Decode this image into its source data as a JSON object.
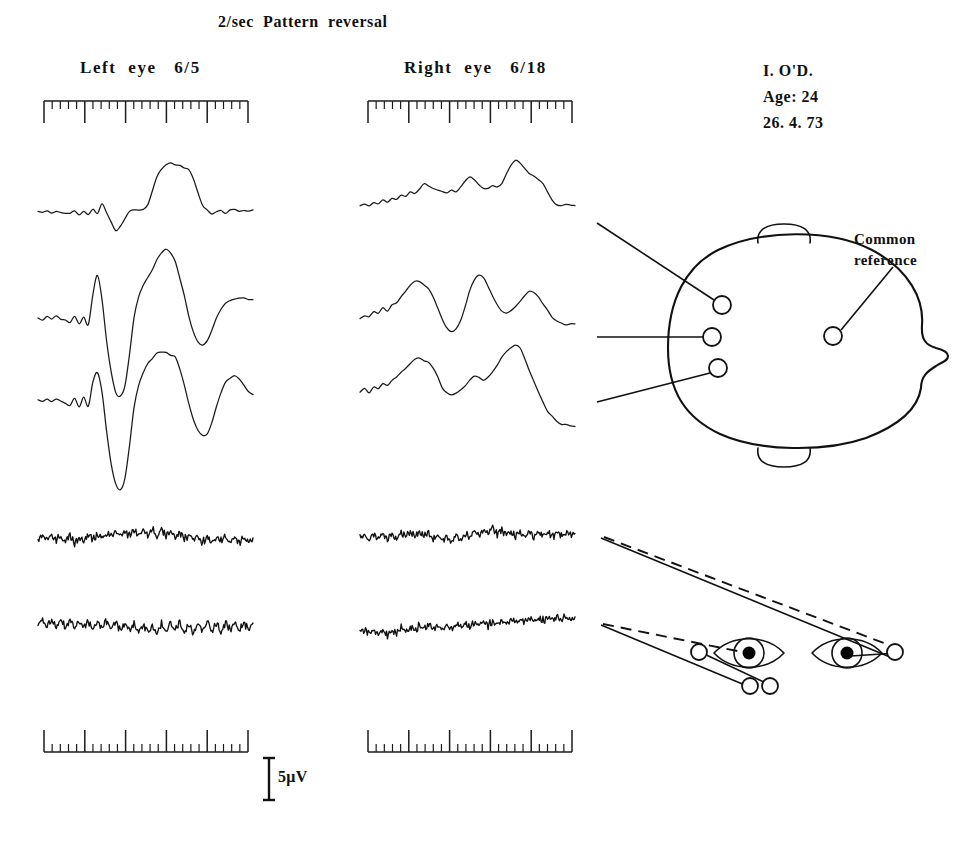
{
  "figure": {
    "title": "2/sec  Pattern  reversal",
    "type": "visual-evoked-potential-recording"
  },
  "columns": {
    "left": {
      "label": "Left  eye   6/5",
      "eye": "Left",
      "acuity": "6/5"
    },
    "right": {
      "label": "Right  eye   6/18",
      "eye": "Right",
      "acuity": "6/18"
    }
  },
  "patient": {
    "initials": "I. O'D.",
    "age_line": "Age: 24",
    "date_line": "26. 4. 73"
  },
  "annotations": {
    "common_reference_line1": "Common",
    "common_reference_line2": "reference"
  },
  "calibration": {
    "amplitude_label": "5μV",
    "amplitude_value": 5,
    "amplitude_unit": "μV"
  },
  "chart_data": {
    "type": "line",
    "title": "2/sec  Pattern  reversal",
    "xlabel": "",
    "ylabel": "",
    "grid": false,
    "legend_position": "none",
    "axis_note": "Horizontal timebase rulers at top and bottom of each column; vertical 5 microvolt calibration bar at lower centre.",
    "timebase": {
      "major_ticks": 5,
      "minor_ticks_per_major": 5,
      "top_ruler_tick_direction": "down",
      "bottom_ruler_tick_direction": "up"
    },
    "series": [
      {
        "name": "Left eye - channel 1 (upper occipital)",
        "column": "left",
        "values": [
          0,
          -1,
          2,
          -1,
          1,
          0,
          -1,
          -2,
          1,
          -3,
          0,
          -4,
          3,
          -3,
          12,
          -2,
          -14,
          -26,
          -20,
          -9,
          2,
          4,
          3,
          4,
          10,
          30,
          48,
          60,
          66,
          68,
          66,
          64,
          62,
          58,
          45,
          26,
          10,
          2,
          -2,
          0,
          2,
          -1,
          2,
          3,
          2,
          2,
          1,
          2
        ]
      },
      {
        "name": "Left eye - channel 2 (mid occipital)",
        "column": "left",
        "values": [
          0,
          -2,
          3,
          -2,
          2,
          -1,
          -3,
          -6,
          2,
          -7,
          2,
          -8,
          30,
          55,
          24,
          -30,
          -70,
          -95,
          -100,
          -88,
          -46,
          0,
          28,
          42,
          52,
          62,
          76,
          84,
          88,
          84,
          72,
          52,
          28,
          2,
          -18,
          -30,
          -34,
          -30,
          -16,
          0,
          12,
          18,
          22,
          24,
          26,
          25,
          24,
          24
        ]
      },
      {
        "name": "Left eye - channel 3 (lower occipital)",
        "column": "left",
        "values": [
          0,
          -2,
          2,
          -2,
          2,
          -1,
          -4,
          -6,
          2,
          -8,
          3,
          -9,
          22,
          34,
          10,
          -40,
          -82,
          -108,
          -116,
          -100,
          -58,
          -10,
          18,
          34,
          46,
          54,
          60,
          62,
          60,
          58,
          56,
          40,
          18,
          -6,
          -26,
          -40,
          -46,
          -44,
          -30,
          -8,
          10,
          22,
          28,
          30,
          26,
          18,
          10,
          6
        ]
      },
      {
        "name": "Left eye - channel 4 (noisy / flat response)",
        "column": "left",
        "noise": true,
        "values": [
          0,
          6,
          -4,
          8,
          -6,
          4,
          -10,
          6,
          -14,
          2,
          -8,
          10,
          -4,
          12,
          0,
          14,
          4,
          18,
          6,
          22,
          8,
          24,
          10,
          26,
          6,
          28,
          4,
          26,
          8,
          22,
          2,
          18,
          -4,
          12,
          -8,
          6,
          -12,
          2,
          -14,
          0,
          -10,
          4,
          -12,
          2,
          -14,
          -2,
          -10,
          0
        ]
      },
      {
        "name": "Left eye - channel 5 (noisy / flat response)",
        "column": "left",
        "noise": true,
        "values": [
          0,
          14,
          -6,
          18,
          -8,
          16,
          -10,
          20,
          -6,
          14,
          -12,
          10,
          -14,
          12,
          -10,
          14,
          -12,
          8,
          -16,
          6,
          -18,
          4,
          -20,
          2,
          -22,
          0,
          -24,
          4,
          -20,
          6,
          -18,
          8,
          -22,
          4,
          -24,
          6,
          -20,
          10,
          -18,
          8,
          -22,
          6,
          -18,
          10,
          -16,
          8,
          -14,
          6
        ]
      },
      {
        "name": "Right eye - channel 1 (upper occipital, delayed)",
        "column": "right",
        "values": [
          0,
          2,
          -1,
          3,
          2,
          6,
          4,
          10,
          8,
          14,
          12,
          18,
          16,
          22,
          30,
          26,
          22,
          20,
          18,
          16,
          20,
          18,
          24,
          34,
          40,
          34,
          28,
          24,
          22,
          26,
          24,
          30,
          44,
          56,
          62,
          58,
          50,
          44,
          40,
          36,
          30,
          18,
          6,
          0,
          -2,
          0,
          1,
          0
        ]
      },
      {
        "name": "Right eye - channel 2 (mid occipital, delayed)",
        "column": "right",
        "values": [
          0,
          4,
          2,
          8,
          6,
          14,
          10,
          18,
          22,
          30,
          38,
          46,
          52,
          50,
          46,
          40,
          30,
          14,
          -2,
          -14,
          -20,
          -16,
          -4,
          16,
          38,
          54,
          60,
          56,
          44,
          30,
          18,
          10,
          6,
          10,
          16,
          24,
          32,
          38,
          36,
          30,
          20,
          10,
          2,
          -4,
          -8,
          -10,
          -9,
          -8
        ]
      },
      {
        "name": "Right eye - channel 3 (lower occipital, delayed)",
        "column": "right",
        "values": [
          0,
          4,
          -2,
          6,
          4,
          12,
          10,
          16,
          20,
          28,
          34,
          40,
          46,
          48,
          44,
          40,
          34,
          22,
          6,
          -2,
          -4,
          -2,
          2,
          8,
          16,
          22,
          20,
          16,
          20,
          28,
          38,
          48,
          56,
          62,
          66,
          60,
          46,
          30,
          14,
          0,
          -14,
          -26,
          -34,
          -40,
          -44,
          -46,
          -47,
          -48
        ]
      },
      {
        "name": "Right eye - channel 4 (noisy / residual)",
        "column": "right",
        "noise": true,
        "values": [
          0,
          8,
          -6,
          12,
          -4,
          16,
          -8,
          14,
          -2,
          18,
          4,
          20,
          6,
          18,
          2,
          14,
          -4,
          10,
          -8,
          6,
          -10,
          8,
          -6,
          14,
          2,
          20,
          10,
          26,
          14,
          30,
          12,
          24,
          8,
          20,
          6,
          18,
          4,
          16,
          2,
          18,
          6,
          16,
          4,
          18,
          8,
          16,
          6,
          14
        ]
      },
      {
        "name": "Right eye - channel 5 (noisy / residual, upward drift)",
        "column": "right",
        "noise": true,
        "values": [
          0,
          8,
          -4,
          10,
          -8,
          6,
          -12,
          4,
          -6,
          12,
          2,
          16,
          6,
          20,
          10,
          22,
          8,
          18,
          6,
          20,
          10,
          24,
          14,
          26,
          16,
          28,
          18,
          30,
          20,
          32,
          22,
          34,
          26,
          36,
          28,
          38,
          30,
          40,
          32,
          42,
          34,
          44,
          36,
          46,
          38,
          44,
          40,
          46
        ]
      }
    ]
  },
  "head_diagram": {
    "name": "head-electrode-montage",
    "view": "vertex view, nose to the right",
    "electrodes": [
      {
        "id": "occipital-upper",
        "label": ""
      },
      {
        "id": "occipital-mid",
        "label": ""
      },
      {
        "id": "occipital-lower",
        "label": ""
      },
      {
        "id": "common-reference",
        "label": "Common reference"
      }
    ]
  },
  "eye_diagram": {
    "name": "visual-field-pathway-diagram",
    "eyes": [
      "left-eye",
      "right-eye"
    ],
    "line_styles": [
      "solid",
      "dashed"
    ]
  }
}
